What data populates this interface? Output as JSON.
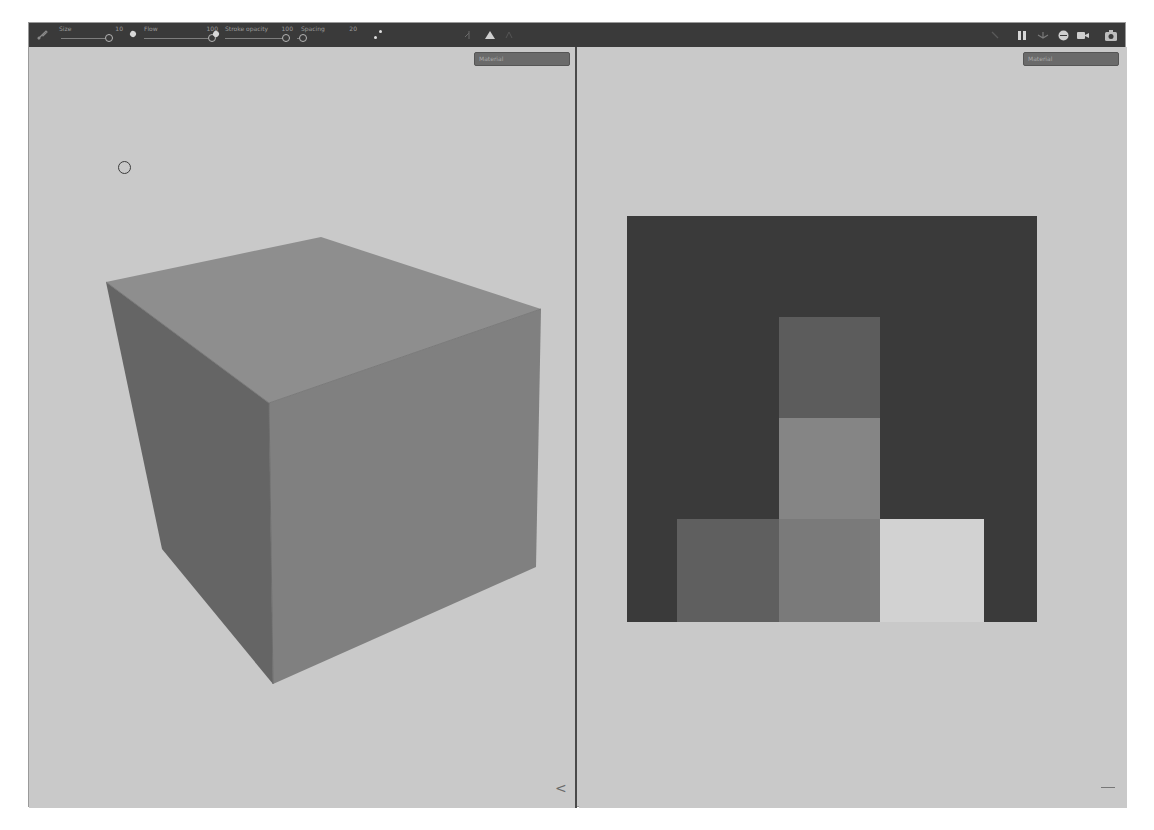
{
  "toolbar": {
    "params": [
      {
        "label": "Size",
        "value": "10"
      },
      {
        "label": "Flow",
        "value": "100"
      },
      {
        "label": "Stroke opacity",
        "value": "100"
      },
      {
        "label": "Spacing",
        "value": "20"
      }
    ],
    "tools": [
      "brush-tool",
      "pen-pressure-size",
      "pen-pressure-flow",
      "symmetry",
      "mirror-mode"
    ],
    "right_icons": [
      "screenshot",
      "pause",
      "layers",
      "environment",
      "camera",
      "capture"
    ]
  },
  "viewport_3d": {
    "dropdown_value": "Material",
    "object": "cube"
  },
  "viewport_2d": {
    "dropdown_value": "Material",
    "texture_blocks": [
      {
        "name": "background",
        "color": "#3a3a3a"
      },
      {
        "name": "top-center",
        "color": "#5c5c5c"
      },
      {
        "name": "middle-center",
        "color": "#858585"
      },
      {
        "name": "bottom-left",
        "color": "#5f5f5f"
      },
      {
        "name": "bottom-center",
        "color": "#7a7a7a"
      },
      {
        "name": "bottom-right",
        "color": "#d2d2d2"
      }
    ]
  },
  "colors": {
    "toolbar_bg": "#3a3a3a",
    "viewport_bg": "#c9c9c9",
    "cube_top": "#8e8e8e",
    "cube_left": "#656565",
    "cube_right": "#808080"
  }
}
